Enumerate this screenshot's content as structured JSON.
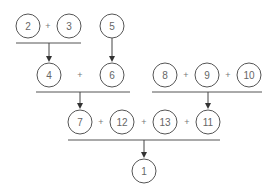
{
  "diagram": {
    "title": "",
    "stroke_color": "#555555",
    "text_color": "#666666",
    "node_radius": 12,
    "nodes": [
      {
        "id": "n2",
        "label": "2",
        "x": 28,
        "y": 26
      },
      {
        "id": "n3",
        "label": "3",
        "x": 69,
        "y": 26
      },
      {
        "id": "n5",
        "label": "5",
        "x": 112,
        "y": 26
      },
      {
        "id": "n4",
        "label": "4",
        "x": 49,
        "y": 75
      },
      {
        "id": "n6",
        "label": "6",
        "x": 112,
        "y": 75
      },
      {
        "id": "n8",
        "label": "8",
        "x": 165,
        "y": 75
      },
      {
        "id": "n9",
        "label": "9",
        "x": 207,
        "y": 75
      },
      {
        "id": "n10",
        "label": "10",
        "x": 249,
        "y": 75
      },
      {
        "id": "n7",
        "label": "7",
        "x": 80,
        "y": 122
      },
      {
        "id": "n12",
        "label": "12",
        "x": 122,
        "y": 122
      },
      {
        "id": "n13",
        "label": "13",
        "x": 165,
        "y": 122
      },
      {
        "id": "n11",
        "label": "11",
        "x": 208,
        "y": 122
      },
      {
        "id": "n1",
        "label": "1",
        "x": 144,
        "y": 171
      }
    ],
    "operators": [
      {
        "label": "+",
        "x": 48,
        "y": 26
      },
      {
        "label": "+",
        "x": 80,
        "y": 75
      },
      {
        "label": "+",
        "x": 186,
        "y": 75
      },
      {
        "label": "+",
        "x": 228,
        "y": 75
      },
      {
        "label": "+",
        "x": 101,
        "y": 122
      },
      {
        "label": "+",
        "x": 144,
        "y": 122
      },
      {
        "label": "+",
        "x": 187,
        "y": 122
      }
    ],
    "sum_bars": [
      {
        "x1": 16,
        "x2": 81,
        "y": 43
      },
      {
        "x1": 36,
        "x2": 130,
        "y": 92
      },
      {
        "x1": 152,
        "x2": 262,
        "y": 92
      },
      {
        "x1": 68,
        "x2": 220,
        "y": 140
      }
    ],
    "arrows": [
      {
        "from": "2+3",
        "to": "4",
        "x": 49,
        "y1": 43,
        "y2": 62
      },
      {
        "from": "5",
        "to": "6",
        "x": 112,
        "y1": 38,
        "y2": 62
      },
      {
        "from": "4+6",
        "to": "7",
        "x": 80,
        "y1": 92,
        "y2": 109
      },
      {
        "from": "8+9+10",
        "to": "11",
        "x": 208,
        "y1": 92,
        "y2": 109
      },
      {
        "from": "7+12+13+11",
        "to": "1",
        "x": 144,
        "y1": 140,
        "y2": 158
      }
    ]
  }
}
